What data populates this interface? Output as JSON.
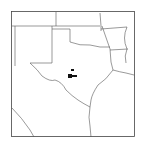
{
  "map": {
    "title": "Distribution map",
    "region": "Texas and surrounding states",
    "states": [
      "Texas",
      "New Mexico",
      "Oklahoma",
      "Arkansas",
      "Louisiana",
      "Colorado",
      "Kansas",
      "Missouri"
    ],
    "marker_color": "#111111",
    "occurrences": [
      {
        "label": "occurrence-1",
        "lon": -99.3,
        "lat": 32.0
      },
      {
        "label": "occurrence-2",
        "lon": -99.5,
        "lat": 31.4
      },
      {
        "label": "occurrence-3",
        "lon": -98.9,
        "lat": 31.3
      }
    ]
  }
}
